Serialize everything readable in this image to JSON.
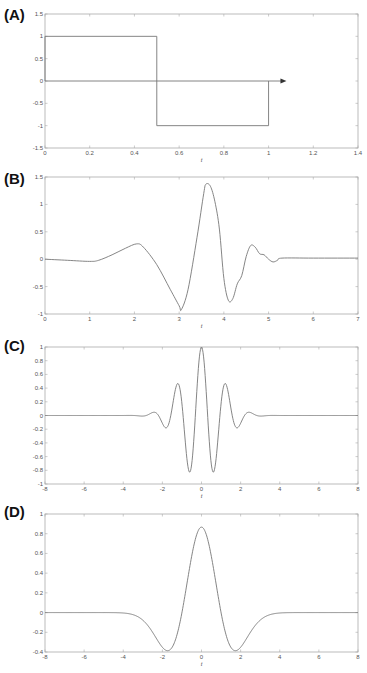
{
  "colors": {
    "frame": "#aaaaaa",
    "curve": "#777777",
    "arrow": "#333333",
    "label": "#111111"
  },
  "chart_data": [
    {
      "id": "A",
      "panel_label": "(A)",
      "type": "line",
      "title": "",
      "description": "Haar wavelet",
      "xlabel": "t",
      "ylabel": "",
      "xlim": [
        0,
        1.4
      ],
      "ylim": [
        -1.5,
        1.5
      ],
      "xticks": [
        0,
        0.2,
        0.4,
        0.6,
        0.8,
        1,
        1.2,
        1.4
      ],
      "xtick_labels": [
        "0",
        "0.2",
        "0.4",
        "0.6",
        "0.8",
        "1",
        "1.2",
        "1.4"
      ],
      "yticks": [
        -1.5,
        -1,
        -0.5,
        0,
        0.5,
        1,
        1.5
      ],
      "ytick_labels": [
        "-1.5",
        "-1",
        "-0.5",
        "0",
        "0.5",
        "1",
        "1.5"
      ],
      "grid": false,
      "series": [
        {
          "name": "psi(t)",
          "x": [
            0,
            0,
            0.5,
            0.5,
            1,
            1
          ],
          "y": [
            0,
            1,
            1,
            -1,
            -1,
            0
          ]
        }
      ],
      "annotations": [
        {
          "type": "arrow",
          "from": [
            0,
            0
          ],
          "to": [
            1.08,
            0
          ]
        }
      ],
      "frame_px": {
        "top": 14,
        "bottom": 148,
        "left": 45,
        "right": 358
      }
    },
    {
      "id": "B",
      "panel_label": "(B)",
      "type": "line",
      "title": "",
      "description": "Daubechies wavelet",
      "xlabel": "t",
      "ylabel": "",
      "xlim": [
        0,
        7
      ],
      "ylim": [
        -1,
        1.5
      ],
      "xticks": [
        0,
        1,
        2,
        3,
        4,
        5,
        6,
        7
      ],
      "xtick_labels": [
        "0",
        "1",
        "2",
        "3",
        "4",
        "5",
        "6",
        "7"
      ],
      "yticks": [
        -1,
        -0.5,
        0,
        0.5,
        1,
        1.5
      ],
      "ytick_labels": [
        "-1",
        "-0.5",
        "0",
        "0.5",
        "1",
        "1.5"
      ],
      "grid": false,
      "series": [
        {
          "name": "psi(t)",
          "x": [
            0,
            0.5,
            1.0,
            1.2,
            1.5,
            1.8,
            2.05,
            2.2,
            2.5,
            2.8,
            3.0,
            3.05,
            3.2,
            3.4,
            3.55,
            3.6,
            3.7,
            3.8,
            3.9,
            4.0,
            4.1,
            4.2,
            4.3,
            4.4,
            4.5,
            4.6,
            4.7,
            4.8,
            4.9,
            5.0,
            5.1,
            5.2,
            5.3,
            6.0,
            7.0
          ],
          "y": [
            0,
            -0.02,
            -0.04,
            -0.02,
            0.08,
            0.2,
            0.28,
            0.22,
            -0.1,
            -0.55,
            -0.85,
            -0.92,
            -0.55,
            0.4,
            1.2,
            1.37,
            1.33,
            1.05,
            0.55,
            -0.35,
            -0.75,
            -0.72,
            -0.45,
            -0.3,
            0.05,
            0.25,
            0.22,
            0.1,
            0.08,
            0.0,
            -0.05,
            -0.02,
            0.02,
            0.02,
            0.02
          ]
        }
      ],
      "frame_px": {
        "top": 177,
        "bottom": 314,
        "left": 45,
        "right": 358
      }
    },
    {
      "id": "C",
      "panel_label": "(C)",
      "type": "line",
      "title": "",
      "description": "Morlet wavelet",
      "xlabel": "t",
      "ylabel": "",
      "xlim": [
        -8,
        8
      ],
      "ylim": [
        -1,
        1
      ],
      "xticks": [
        -8,
        -6,
        -4,
        -2,
        0,
        2,
        4,
        6,
        8
      ],
      "xtick_labels": [
        "-8",
        "-6",
        "-4",
        "-2",
        "0",
        "2",
        "4",
        "6",
        "8"
      ],
      "yticks": [
        -1,
        -0.8,
        -0.6,
        -0.4,
        -0.2,
        0,
        0.2,
        0.4,
        0.6,
        0.8,
        1
      ],
      "ytick_labels": [
        "-1",
        "-0.8",
        "-0.6",
        "-0.4",
        "-0.2",
        "0",
        "0.2",
        "0.4",
        "0.6",
        "0.8",
        "1"
      ],
      "grid": false,
      "series": [
        {
          "name": "psi(t)",
          "formula": "exp(-t^2/2)*cos(5t)",
          "x_range": [
            -8,
            8
          ]
        }
      ],
      "frame_px": {
        "top": 347,
        "bottom": 484,
        "left": 45,
        "right": 358
      }
    },
    {
      "id": "D",
      "panel_label": "(D)",
      "type": "line",
      "title": "",
      "description": "Mexican hat wavelet",
      "xlabel": "t",
      "ylabel": "",
      "xlim": [
        -8,
        8
      ],
      "ylim": [
        -0.4,
        1
      ],
      "xticks": [
        -8,
        -6,
        -4,
        -2,
        0,
        2,
        4,
        6,
        8
      ],
      "xtick_labels": [
        "-8",
        "-6",
        "-4",
        "-2",
        "0",
        "2",
        "4",
        "6",
        "8"
      ],
      "yticks": [
        -0.4,
        -0.2,
        0,
        0.2,
        0.4,
        0.6,
        0.8,
        1
      ],
      "ytick_labels": [
        "-0.4",
        "-0.2",
        "0",
        "0.2",
        "0.4",
        "0.6",
        "0.8",
        "1"
      ],
      "grid": false,
      "series": [
        {
          "name": "psi(t)",
          "formula": "0.867*(1-t^2)*exp(-t^2/2)",
          "peak": 0.867,
          "x_range": [
            -8,
            8
          ]
        }
      ],
      "frame_px": {
        "top": 514,
        "bottom": 652,
        "left": 45,
        "right": 358
      }
    }
  ]
}
